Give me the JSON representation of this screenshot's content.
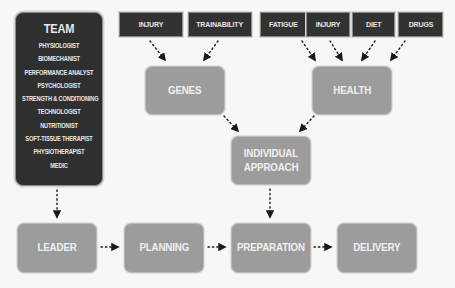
{
  "team": {
    "title": "TEAM",
    "members": [
      "PHYSIOLOGIST",
      "BIOMECHANIST",
      "PERFORMANCE ANALYST",
      "PSYCHOLOGIST",
      "STRENGTH & CONDITIONING",
      "TECHNOLOGIST",
      "NUTRITIONIST",
      "SOFT-TISSUE THERAPIST",
      "PHYSIOTHERAPIST",
      "MEDIC"
    ]
  },
  "genes_factors": [
    "INJURY",
    "TRAINABILITY"
  ],
  "health_factors": [
    "FATIGUE",
    "INJURY",
    "DIET",
    "DRUGS"
  ],
  "nodes": {
    "genes": "GENES",
    "health": "HEALTH",
    "individual_approach_line1": "INDIVIDUAL",
    "individual_approach_line2": "APPROACH"
  },
  "pipeline": [
    "LEADER",
    "PLANNING",
    "PREPARATION",
    "DELIVERY"
  ],
  "colors": {
    "dark_box": "#323232",
    "grey_box": "#9c9c9c",
    "background": "#f7f7f6",
    "arrow": "#1a1a1a"
  }
}
